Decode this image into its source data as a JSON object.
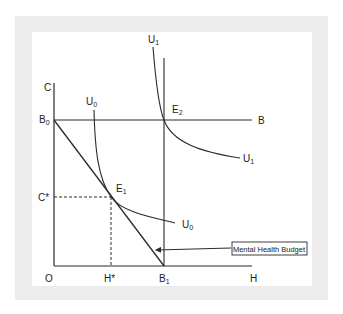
{
  "diagram": {
    "axes": {
      "y_label": "C",
      "x_label": "H",
      "origin_label": "O"
    },
    "labels": {
      "B0": {
        "main": "B",
        "sub": "0"
      },
      "B": "B",
      "B1": {
        "main": "B",
        "sub": "1"
      },
      "C_star": "C*",
      "H_star": "H*",
      "E1": {
        "main": "E",
        "sub": "1"
      },
      "E2": {
        "main": "E",
        "sub": "2"
      },
      "U0_top": {
        "main": "U",
        "sub": "0"
      },
      "U0_right": {
        "main": "U",
        "sub": "0"
      },
      "U1_top": {
        "main": "U",
        "sub": "1"
      },
      "U1_right": {
        "main": "U",
        "sub": "1"
      }
    },
    "callout": "Mental Health Budget",
    "curves": [
      {
        "name": "budget-line",
        "from": "B0",
        "to": "B1"
      },
      {
        "name": "horizontal-budget",
        "from": "B0",
        "to": "B"
      },
      {
        "name": "vertical-B1",
        "at": "B1"
      },
      {
        "name": "indifference-U0",
        "tangent_at": "E1"
      },
      {
        "name": "indifference-U1",
        "passes": "E2"
      }
    ]
  },
  "colors": {
    "line": "#2a2a2a",
    "frame": "#ececec",
    "panel": "#ffffff"
  }
}
